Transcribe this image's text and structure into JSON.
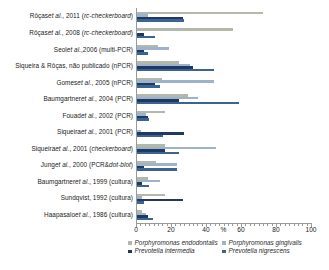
{
  "chart_data": {
    "type": "bar",
    "orientation": "horizontal",
    "title": "",
    "xlabel": "%",
    "ylabel": "",
    "xlim": [
      0,
      100
    ],
    "xticks": [
      0,
      20,
      40,
      60,
      80,
      100
    ],
    "xtick_labels": [
      "0",
      "20",
      "40",
      "60",
      "80",
      "100"
    ],
    "grid": false,
    "legend_position": "bottom",
    "categories": [
      "Rôças et al., 2011 (rc-checkerboard)",
      "Rôças et al., 2008 (rc-checkerboard)",
      "Seol et al.,2006 (multi-PCR)",
      "Siqueira & Rôças, não publicado (nPCR)",
      "Gomes et al., 2005 (nPCR)",
      "Baumgartner et al., 2004 (PCR)",
      "Fouad et al.,  2002 (PCR)",
      "Siqueira et al., 2001 (PCR)",
      "Siqueira et al., 2001 (checkerboard)",
      "Jung et al., 2000 (PCR&dot-blot)",
      "Baumgartner et al., 1999 (cultura)",
      "Sundqvist, 1992 (cultura)",
      "Haapasalo et al., 1986 (cultura)"
    ],
    "series": [
      {
        "name": "Porphyromonas endodontalis",
        "color": "#b3b8a8",
        "values": [
          72,
          55,
          12,
          24,
          14,
          29,
          16,
          0,
          16,
          11,
          6,
          16,
          3
        ]
      },
      {
        "name": "Porphyromonas gingivalis",
        "color": "#9db3cc",
        "values": [
          6,
          0,
          18,
          30,
          44,
          35,
          5,
          2,
          45,
          23,
          13,
          3,
          5
        ]
      },
      {
        "name": "Prevotella intermedia",
        "color": "#203864",
        "values": [
          26,
          4,
          4,
          32,
          10,
          24,
          6,
          27,
          16,
          4,
          3,
          26,
          6
        ],
        "note": "values near-zero render as a thin stub"
      },
      {
        "name": "Prevotella nigrescens",
        "color": "#3d6491",
        "values": [
          27,
          10,
          6,
          44,
          13,
          58,
          7,
          15,
          24,
          23,
          7,
          4,
          9
        ]
      }
    ]
  },
  "legend": {
    "items": [
      {
        "label": "Porphyromonas endodontalis",
        "color": "#b3b8a8"
      },
      {
        "label": "Porphyromonas gingivalis",
        "color": "#9db3cc"
      },
      {
        "label": "Prevotella intermedia",
        "color": "#203864"
      },
      {
        "label": "Prevotella nigrescens",
        "color": "#3d6491"
      }
    ]
  },
  "axis": {
    "unit_label": "%"
  }
}
